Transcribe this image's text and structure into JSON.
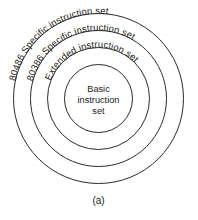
{
  "figure": {
    "type": "concentric-rings-diagram",
    "caption": "(a)",
    "background_color": "#ffffff",
    "stroke_color": "#2b2b2b",
    "text_color": "#1a1a1a",
    "center": {
      "x": 98.5,
      "y": 98.5
    },
    "rings": [
      {
        "id": "ring-80486",
        "label": "80486 Specific instruction set",
        "radius": 85,
        "label_on_arc": true,
        "level": 4
      },
      {
        "id": "ring-80386",
        "label": "80386 Specific instruction set",
        "radius": 68,
        "label_on_arc": true,
        "level": 3
      },
      {
        "id": "ring-extended",
        "label": "Extended instruction set",
        "radius": 51,
        "label_on_arc": true,
        "level": 2
      },
      {
        "id": "ring-basic",
        "label": "Basic instruction set",
        "radius": 34,
        "label_on_arc": false,
        "level": 1,
        "label_lines": [
          "Basic",
          "instruction",
          "set"
        ]
      }
    ]
  }
}
